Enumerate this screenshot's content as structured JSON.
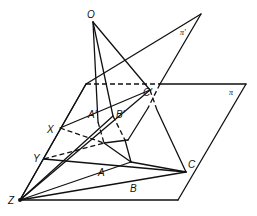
{
  "figure": {
    "labels": {
      "O": "O",
      "A": "A",
      "B": "B",
      "C": "C",
      "A_prime": "A′",
      "B_prime": "B′",
      "C_prime": "C′",
      "X": "X",
      "Y": "Y",
      "Z": "Z",
      "plane_pi": "π",
      "plane_pi_prime": "π′"
    },
    "points": {
      "O": [
        93,
        22
      ],
      "A": [
        104,
        143
      ],
      "B": [
        131,
        162
      ],
      "C": [
        186,
        172
      ],
      "A_prime": [
        98,
        122
      ],
      "B_prime": [
        113,
        116
      ],
      "C_prime": [
        150,
        90
      ],
      "X": [
        60,
        128
      ],
      "Y": [
        44,
        159
      ],
      "Z": [
        20,
        200
      ]
    },
    "colors": {
      "stroke": "#111111",
      "background": "#ffffff"
    }
  }
}
